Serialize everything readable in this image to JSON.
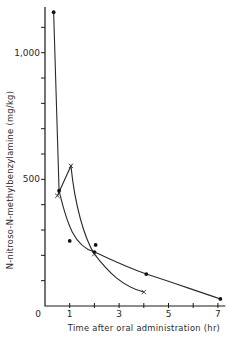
{
  "chart_data": {
    "type": "scatter",
    "title": "",
    "xlabel": "Time after oral administration (hr)",
    "ylabel": "N-nitroso-N-methylbenzylamine (mg/kg)",
    "xlim": [
      0,
      7.3
    ],
    "ylim": [
      0,
      1180
    ],
    "x_tick_labels": [
      "0",
      "1",
      "3",
      "5",
      "7"
    ],
    "x_ticks": [
      1,
      2,
      3,
      4,
      5,
      6,
      7
    ],
    "y_tick_labels": [
      "500",
      "1,000"
    ],
    "y_ticks": [
      100,
      200,
      300,
      400,
      500,
      600,
      700,
      800,
      900,
      1000,
      1100
    ],
    "grid": false,
    "legend": null,
    "series": [
      {
        "name": "dots",
        "marker": "filled-circle",
        "points": [
          {
            "x": 0.35,
            "y": 1160
          },
          {
            "x": 0.57,
            "y": 455
          },
          {
            "x": 1.0,
            "y": 257
          },
          {
            "x": 2.0,
            "y": 213
          },
          {
            "x": 2.05,
            "y": 241
          },
          {
            "x": 4.1,
            "y": 126
          },
          {
            "x": 7.1,
            "y": 28
          }
        ],
        "curve": [
          {
            "x": 0.35,
            "y": 1160
          },
          {
            "x": 0.57,
            "y": 455
          },
          {
            "x": 2.0,
            "y": 213
          },
          {
            "x": 4.1,
            "y": 126
          },
          {
            "x": 7.1,
            "y": 28
          }
        ]
      },
      {
        "name": "crosses",
        "marker": "x",
        "points": [
          {
            "x": 0.5,
            "y": 435
          },
          {
            "x": 1.05,
            "y": 553
          },
          {
            "x": 2.0,
            "y": 205
          },
          {
            "x": 4.0,
            "y": 55
          }
        ],
        "curve": [
          {
            "x": 0.5,
            "y": 435
          },
          {
            "x": 1.05,
            "y": 553
          },
          {
            "x": 2.0,
            "y": 205
          },
          {
            "x": 4.0,
            "y": 55
          }
        ]
      }
    ]
  }
}
